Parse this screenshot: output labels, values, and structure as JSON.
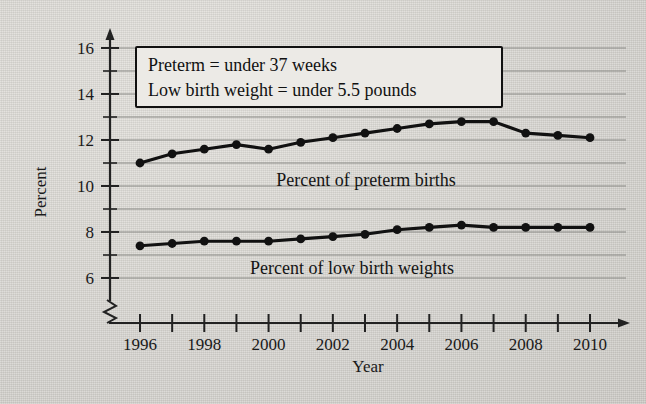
{
  "chart_data": {
    "type": "line",
    "title": "",
    "xlabel": "Year",
    "ylabel": "Percent",
    "x": [
      1996,
      1997,
      1998,
      1999,
      2000,
      2001,
      2002,
      2003,
      2004,
      2005,
      2006,
      2007,
      2008,
      2009,
      2010
    ],
    "xlim": [
      1996,
      2010
    ],
    "ylim": [
      5.6,
      16.4
    ],
    "yticks": [
      6,
      8,
      10,
      12,
      14,
      16
    ],
    "yticks_minor": [
      7,
      9,
      11,
      13,
      15
    ],
    "xticklabels": [
      "1996",
      "1998",
      "2000",
      "2002",
      "2004",
      "2006",
      "2008",
      "2010"
    ],
    "xticklabel_years": [
      1996,
      1998,
      2000,
      2002,
      2004,
      2006,
      2008,
      2010
    ],
    "grid": true,
    "grid_axis": "y",
    "axis_break_x": true,
    "legend": "inline-labels",
    "series": [
      {
        "name": "Percent of preterm births",
        "values": [
          11.0,
          11.4,
          11.6,
          11.8,
          11.6,
          11.9,
          12.1,
          12.3,
          12.5,
          12.7,
          12.8,
          12.8,
          12.3,
          12.2,
          12.1
        ]
      },
      {
        "name": "Percent of low birth weights",
        "values": [
          7.4,
          7.5,
          7.6,
          7.6,
          7.6,
          7.7,
          7.8,
          7.9,
          8.1,
          8.2,
          8.3,
          8.2,
          8.2,
          8.2,
          8.2
        ]
      }
    ],
    "annotations": {
      "note_box": {
        "line1": "Preterm = under 37 weeks",
        "line2": "Low birth weight = under 5.5 pounds"
      },
      "series_labels": [
        "Percent of preterm births",
        "Percent of low birth weights"
      ]
    },
    "colors": {
      "line": "#111111",
      "grid": "#8a8a86",
      "axis": "#222222",
      "background": "#d8d6d1",
      "note_fill": "#eceae6"
    }
  }
}
